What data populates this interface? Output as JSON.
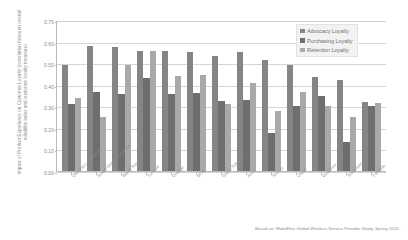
{
  "chart_data": {
    "type": "bar",
    "title": "",
    "xlabel": "",
    "ylabel": "Impact of Product Experience on Customer Loyalty (correlation between overall reliability index and customer loyalty measure)",
    "ylim": [
      0.0,
      0.7
    ],
    "ytick_labels": [
      "0.70",
      "0.60",
      "0.50",
      "0.40",
      "0.30",
      "0.20",
      "0.10",
      "0.00"
    ],
    "ytick_values": [
      0.7,
      0.6,
      0.5,
      0.4,
      0.3,
      0.2,
      0.1,
      0.0
    ],
    "grid": "horizontal",
    "legend_position": "top-right-inside",
    "categories": [
      "OVERALL SAMPLE",
      "Smart Communications",
      "Warid Telecom",
      "Turkcell",
      "Orange",
      "MTN",
      "Globe Telecom",
      "Airtel",
      "Telenor",
      "Ufone",
      "Vodafone",
      "Telkomsel",
      "T-Mobile"
    ],
    "series": [
      {
        "name": "Advocacy Loyalty",
        "color": "#858585",
        "values": [
          0.49,
          0.58,
          0.575,
          0.555,
          0.555,
          0.55,
          0.535,
          0.55,
          0.515,
          0.49,
          0.435,
          0.42,
          0.32
        ]
      },
      {
        "name": "Purchasing Loyalty",
        "color": "#6e6e6e",
        "values": [
          0.31,
          0.365,
          0.355,
          0.43,
          0.355,
          0.36,
          0.325,
          0.33,
          0.175,
          0.3,
          0.35,
          0.135,
          0.3
        ]
      },
      {
        "name": "Retention Loyalty",
        "color": "#a9a9a9",
        "values": [
          0.34,
          0.25,
          0.49,
          0.555,
          0.44,
          0.445,
          0.31,
          0.41,
          0.28,
          0.365,
          0.3,
          0.25,
          0.315
        ]
      }
    ],
    "annotations": {
      "footnote": "Based on: Mob4Hire Global Wireless Service Provider Study, Spring 2010."
    }
  }
}
